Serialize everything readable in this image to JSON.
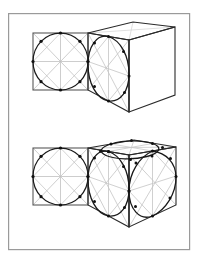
{
  "page": {
    "background_color": "#ffffff",
    "width": 202,
    "height": 264
  },
  "frame": {
    "name": "plate-border",
    "x": 8,
    "y": 13,
    "width": 182,
    "height": 237,
    "stroke": "#9a9a9a",
    "stroke_width": 1.2,
    "fill": "#ffffff"
  },
  "palette": {
    "heavy_ink": "#1a1a1a",
    "medium_ink": "#4a4a4a",
    "light_construction": "#b4b4b4",
    "very_light_construction": "#cccccc",
    "dot_fill": "#111111",
    "paper": "#ffffff"
  },
  "figures": [
    {
      "id": "figure-top",
      "label": "Circle in a square projected onto one face of a cube",
      "flat_square": {
        "name": "orthographic-square-top",
        "x": 33,
        "y": 33,
        "width": 55,
        "height": 57,
        "stroke": "#555555",
        "stroke_width": 1.1,
        "inscribed_circle": {
          "cx": 60.5,
          "cy": 61.5,
          "r": 27.5,
          "stroke": "#1a1a1a",
          "stroke_width": 1.3
        },
        "construction_lines": [
          "diagonals",
          "horizontal-midline",
          "vertical-midline",
          "inner-rotated-square"
        ],
        "construction_stroke": "#bdbdbd",
        "dot_count": 8,
        "dot_radius": 1.5
      },
      "cube": {
        "name": "perspective-cube-top",
        "front_face": [
          [
            88,
            33
          ],
          [
            88,
            90
          ],
          [
            129,
            112
          ],
          [
            129,
            40
          ]
        ],
        "top_face": [
          [
            88,
            33
          ],
          [
            129,
            40
          ],
          [
            175,
            27
          ],
          [
            133,
            22
          ]
        ],
        "right_face": [
          [
            129,
            40
          ],
          [
            175,
            27
          ],
          [
            175,
            95
          ],
          [
            129,
            112
          ]
        ],
        "stroke": "#222222",
        "stroke_width": 1.2,
        "ellipse_face": "front",
        "ellipse": {
          "name": "projected-circle-front-face",
          "stroke": "#1a1a1a",
          "stroke_width": 1.3,
          "dot_count": 8
        },
        "construction_stroke": "#c0c0c0"
      }
    },
    {
      "id": "figure-bottom",
      "label": "Sphere inscribed in a cube: circle projected onto three visible faces",
      "flat_square": {
        "name": "orthographic-square-bottom",
        "x": 33,
        "y": 148,
        "width": 55,
        "height": 57,
        "stroke": "#555555",
        "stroke_width": 1.1,
        "inscribed_circle": {
          "cx": 60.5,
          "cy": 176.5,
          "r": 27.5,
          "stroke": "#1a1a1a",
          "stroke_width": 1.3
        },
        "construction_lines": [
          "diagonals",
          "horizontal-midline",
          "vertical-midline",
          "inner-rotated-square"
        ],
        "construction_stroke": "#bdbdbd",
        "dot_count": 8,
        "dot_radius": 1.5
      },
      "cube": {
        "name": "perspective-cube-bottom",
        "front_face": [
          [
            88,
            148
          ],
          [
            88,
            205
          ],
          [
            129,
            227
          ],
          [
            129,
            155
          ]
        ],
        "top_face": [
          [
            88,
            148
          ],
          [
            129,
            155
          ],
          [
            176,
            147
          ],
          [
            134,
            140
          ]
        ],
        "right_face": [
          [
            129,
            155
          ],
          [
            176,
            147
          ],
          [
            176,
            205
          ],
          [
            129,
            227
          ]
        ],
        "stroke": "#222222",
        "stroke_width": 1.2,
        "ellipse_faces": [
          "front",
          "top",
          "right"
        ],
        "ellipses": [
          {
            "name": "projected-circle-front-face",
            "stroke": "#1a1a1a",
            "stroke_width": 1.3,
            "dot_count": 8
          },
          {
            "name": "projected-circle-top-face",
            "stroke": "#1a1a1a",
            "stroke_width": 1.3,
            "dot_count": 8
          },
          {
            "name": "projected-circle-right-face",
            "stroke": "#1a1a1a",
            "stroke_width": 1.3,
            "dot_count": 8
          }
        ],
        "construction_stroke": "#c0c0c0"
      }
    }
  ]
}
